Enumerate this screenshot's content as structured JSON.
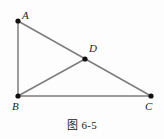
{
  "figure": {
    "caption": "图 6-5",
    "background_color": "#fdfdfd",
    "line_color": "#7d7d7d",
    "point_color": "#111111",
    "label_color": "#252525",
    "labels": {
      "A": "A",
      "B": "B",
      "C": "C",
      "D": "D"
    }
  },
  "chart_data": {
    "type": "diagram",
    "title": "图 6-5",
    "points": [
      {
        "name": "A",
        "x": 18,
        "y": 21,
        "label_dx": 4,
        "label_dy": -11
      },
      {
        "name": "B",
        "x": 18,
        "y": 96,
        "label_dx": -6,
        "label_dy": 5
      },
      {
        "name": "C",
        "x": 151,
        "y": 96,
        "label_dx": -6,
        "label_dy": 5
      },
      {
        "name": "D",
        "x": 85,
        "y": 59,
        "label_dx": 4,
        "label_dy": -16
      }
    ],
    "segments": [
      {
        "name": "AB",
        "from": "A",
        "to": "B"
      },
      {
        "name": "BC",
        "from": "B",
        "to": "C"
      },
      {
        "name": "AC",
        "from": "A",
        "to": "C"
      },
      {
        "name": "BD",
        "from": "B",
        "to": "D"
      }
    ],
    "xlim": [
      0,
      164
    ],
    "ylim": [
      139,
      0
    ],
    "grid": false,
    "legend": null
  }
}
